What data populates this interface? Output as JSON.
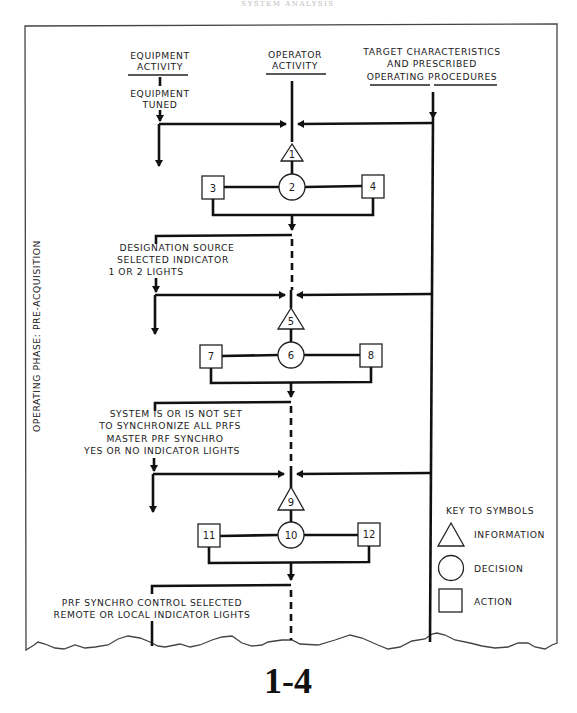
{
  "header": {
    "running_title": "SYSTEM ANALYSIS"
  },
  "columns": {
    "equipment": {
      "line1": "EQUIPMENT",
      "line2": "ACTIVITY"
    },
    "operator": {
      "line1": "OPERATOR",
      "line2": "ACTIVITY"
    },
    "target": {
      "line1": "TARGET CHARACTERISTICS",
      "line2": "AND PRESCRIBED",
      "line3": "OPERATING PROCEDURES"
    }
  },
  "side_label": "OPERATING PHASE:  PRE-ACQUISITION",
  "equipment_states": [
    {
      "lines": [
        "EQUIPMENT",
        "TUNED"
      ]
    },
    {
      "lines": [
        "DESIGNATION SOURCE",
        "SELECTED INDICATOR",
        "1 OR 2  LIGHTS"
      ]
    },
    {
      "lines": [
        "SYSTEM IS OR IS NOT SET",
        "TO SYNCHRONIZE ALL PRFS",
        "MASTER PRF SYNCHRO",
        "YES OR NO INDICATOR LIGHTS"
      ]
    },
    {
      "lines": [
        "PRF SYNCHRO CONTROL SELECTED",
        "REMOTE OR LOCAL INDICATOR LIGHTS"
      ]
    }
  ],
  "stages": [
    {
      "information": "1",
      "decision": "2",
      "action_left": "3",
      "action_right": "4"
    },
    {
      "information": "5",
      "decision": "6",
      "action_left": "7",
      "action_right": "8"
    },
    {
      "information": "9",
      "decision": "10",
      "action_left": "11",
      "action_right": "12"
    }
  ],
  "legend": {
    "title": "KEY TO SYMBOLS",
    "items": [
      {
        "shape": "triangle",
        "label": "INFORMATION"
      },
      {
        "shape": "circle",
        "label": "DECISION"
      },
      {
        "shape": "square",
        "label": "ACTION"
      }
    ]
  },
  "page_number": "1-4"
}
